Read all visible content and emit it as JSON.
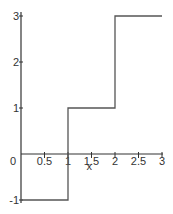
{
  "chart_data": {
    "type": "line",
    "subtype": "step",
    "title": "",
    "xlabel": "x",
    "ylabel": "",
    "xlim": [
      0,
      3
    ],
    "ylim": [
      -1,
      3
    ],
    "grid": false,
    "legend": null,
    "x_ticks": [
      {
        "value": 0,
        "label": "0"
      },
      {
        "value": 0.5,
        "label": "0.5"
      },
      {
        "value": 1,
        "label": "1"
      },
      {
        "value": 1.5,
        "label": "1.5"
      },
      {
        "value": 2,
        "label": "2"
      },
      {
        "value": 2.5,
        "label": "2.5"
      },
      {
        "value": 3,
        "label": "3"
      }
    ],
    "y_ticks": [
      {
        "value": -1,
        "label": "-1"
      },
      {
        "value": 1,
        "label": "1"
      },
      {
        "value": 2,
        "label": "2"
      },
      {
        "value": 3,
        "label": "3"
      }
    ],
    "series": [
      {
        "name": "step function",
        "color": "#555555",
        "points": [
          {
            "x": 0,
            "y": -1
          },
          {
            "x": 1,
            "y": -1
          },
          {
            "x": 1,
            "y": 1
          },
          {
            "x": 2,
            "y": 1
          },
          {
            "x": 2,
            "y": 3
          },
          {
            "x": 3,
            "y": 3
          }
        ],
        "segments": [
          {
            "x_start": 0,
            "x_end": 1,
            "y": -1
          },
          {
            "x_start": 1,
            "x_end": 2,
            "y": 1
          },
          {
            "x_start": 2,
            "x_end": 3,
            "y": 3
          }
        ]
      }
    ]
  },
  "colors": {
    "axis": "#333333",
    "line": "#555555",
    "background": "#ffffff"
  }
}
